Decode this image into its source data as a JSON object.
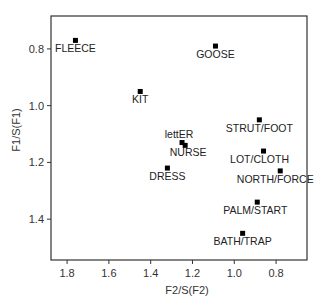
{
  "chart_data": {
    "type": "scatter",
    "title": "",
    "xlabel": "F2/S(F2)",
    "ylabel": "F1/S(F1)",
    "x_reversed": true,
    "y_reversed": true,
    "xlim": [
      1.877,
      0.652
    ],
    "ylim": [
      0.684,
      1.544
    ],
    "x_ticks": [
      1.8,
      1.6,
      1.4,
      1.2,
      1.0,
      0.8
    ],
    "x_tick_labels": [
      "1.8",
      "1.6",
      "1.4",
      "1.2",
      "1.0",
      "0.8"
    ],
    "y_ticks": [
      0.8,
      1.0,
      1.2,
      1.4
    ],
    "y_tick_labels": [
      "0.8",
      "1.0",
      "1.2",
      "1.4"
    ],
    "grid": false,
    "legend": null,
    "marker": "square",
    "marker_color": "#000000",
    "points": [
      {
        "label": "FLEECE",
        "x": 1.76,
        "y": 0.77,
        "label_dx": 0,
        "label_dy": 12,
        "anchor": "middle"
      },
      {
        "label": "KIT",
        "x": 1.45,
        "y": 0.95,
        "label_dx": 0,
        "label_dy": 12,
        "anchor": "middle"
      },
      {
        "label": "GOOSE",
        "x": 1.09,
        "y": 0.79,
        "label_dx": 0,
        "label_dy": 12,
        "anchor": "middle"
      },
      {
        "label": "lettER",
        "x": 1.25,
        "y": 1.13,
        "label_dx": -3,
        "label_dy": -5,
        "anchor": "middle"
      },
      {
        "label": "NURSE",
        "x": 1.235,
        "y": 1.14,
        "label_dx": 3,
        "label_dy": 11,
        "anchor": "middle"
      },
      {
        "label": "DRESS",
        "x": 1.32,
        "y": 1.22,
        "label_dx": 0,
        "label_dy": 12,
        "anchor": "middle"
      },
      {
        "label": "STRUT/FOOT",
        "x": 0.88,
        "y": 1.05,
        "label_dx": 0,
        "label_dy": 12,
        "anchor": "middle"
      },
      {
        "label": "LOT/CLOTH",
        "x": 0.86,
        "y": 1.16,
        "label_dx": -4,
        "label_dy": 12,
        "anchor": "middle"
      },
      {
        "label": "NORTH/FORCE",
        "x": 0.78,
        "y": 1.23,
        "label_dx": -5,
        "label_dy": 12,
        "anchor": "middle"
      },
      {
        "label": "PALM/START",
        "x": 0.89,
        "y": 1.34,
        "label_dx": -2,
        "label_dy": 12,
        "anchor": "middle"
      },
      {
        "label": "BATH/TRAP",
        "x": 0.96,
        "y": 1.45,
        "label_dx": 0,
        "label_dy": 12,
        "anchor": "middle"
      }
    ]
  },
  "layout": {
    "plot_left": 51,
    "plot_top": 16,
    "plot_right": 307,
    "plot_bottom": 260
  }
}
